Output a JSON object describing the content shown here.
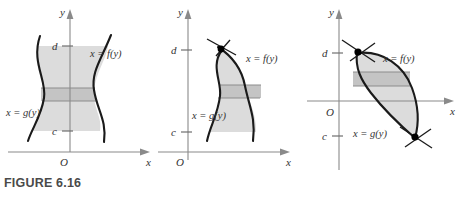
{
  "figure": {
    "caption": "FIGURE 6.16",
    "axis_x_label": "x",
    "axis_y_label": "y",
    "origin_label": "O",
    "tick_upper_label": "d",
    "tick_lower_label": "c",
    "curve_right_label": "x = f(y)",
    "curve_left_label": "x = g(y)",
    "colors": {
      "region_fill": "#dcdcdc",
      "strip_fill": "#c4c4c4",
      "curve": "#1a1a1a",
      "axis": "#8a8a8a",
      "caption": "#4a4a4a"
    }
  },
  "panels": [
    {
      "id": "panel-1",
      "name": "region-between-curves-no-intersection",
      "axis_x_label": "x",
      "axis_y_label": "y",
      "origin_label": "O",
      "tick_upper_label": "d",
      "tick_lower_label": "c",
      "curve_right_label": "x = f(y)",
      "curve_left_label": "x = g(y)",
      "intersection_points": 0
    },
    {
      "id": "panel-2",
      "name": "region-with-one-intersection-at-top",
      "axis_x_label": "x",
      "axis_y_label": "y",
      "origin_label": "O",
      "tick_upper_label": "d",
      "tick_lower_label": "c",
      "curve_right_label": "x = f(y)",
      "curve_left_label": "x = g(y)",
      "intersection_points": 1
    },
    {
      "id": "panel-3",
      "name": "region-with-two-intersections",
      "axis_x_label": "x",
      "axis_y_label": "y",
      "origin_label": "O",
      "tick_upper_label": "d",
      "tick_lower_label": "c",
      "curve_right_label": "x = f(y)",
      "curve_left_label": "x = g(y)",
      "intersection_points": 2
    }
  ]
}
